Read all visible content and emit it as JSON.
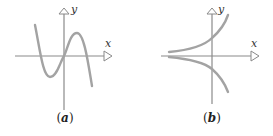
{
  "figure": {
    "panels": [
      {
        "id": "a",
        "caption_open": "(",
        "caption_letter": "a",
        "caption_close": ")",
        "x_axis_label": "x",
        "y_axis_label": "y",
        "curve_description": "cubic-like curve: falls, local min left of origin, passes through origin, local max right, falls"
      },
      {
        "id": "b",
        "caption_open": "(",
        "caption_letter": "b",
        "caption_close": ")",
        "x_axis_label": "x",
        "y_axis_label": "y",
        "curve_description": "two exponential-like curves: one increasing above x-axis, mirror decreasing below"
      }
    ],
    "colors": {
      "axis": "#8a8a8a",
      "curve": "#a3a3a3",
      "text": "#333333"
    }
  }
}
